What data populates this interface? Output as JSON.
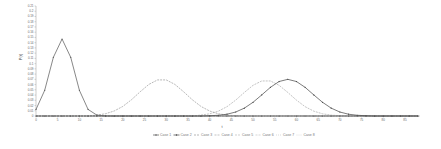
{
  "chart_data": {
    "type": "line",
    "title": "",
    "xlabel": "t",
    "ylabel": "P(t)",
    "xlim": [
      0,
      88
    ],
    "ylim": [
      0,
      0.21
    ],
    "x_ticks": [
      0,
      5,
      10,
      15,
      20,
      25,
      30,
      35,
      40,
      45,
      50,
      55,
      60,
      65,
      70,
      75,
      80,
      85
    ],
    "y_ticks": [
      0,
      0.01,
      0.02,
      0.03,
      0.04,
      0.05,
      0.06,
      0.07,
      0.08,
      0.09,
      0.1,
      0.11,
      0.12,
      0.13,
      0.14,
      0.15,
      0.16,
      0.17,
      0.18,
      0.19,
      0.2,
      0.21
    ],
    "y_tick_labels": [
      "0",
      "0.01",
      "0.02",
      "0.03",
      "0.04",
      "0.05",
      "0.06",
      "0.07",
      "0.08",
      "0.09",
      "0.1",
      "0.11",
      "0.12",
      "0.13",
      "0.14",
      "0.15",
      "0.16",
      "0.17",
      "0.18",
      "0.19",
      "0.2",
      "0.21"
    ],
    "grid": false,
    "legend_position": "bottom",
    "x": [
      0,
      2,
      4,
      6,
      8,
      10,
      12,
      14,
      16,
      18,
      20,
      22,
      24,
      26,
      28,
      30,
      32,
      34,
      36,
      38,
      40,
      42,
      44,
      46,
      48,
      50,
      52,
      54,
      56,
      58,
      60,
      62,
      64,
      66,
      68,
      70,
      72,
      74,
      76,
      78,
      80,
      82,
      84,
      86,
      88
    ],
    "series": [
      {
        "name": "Case 1",
        "color": "#555555",
        "dash": "",
        "marker": true,
        "values": [
          0.0125,
          0.049,
          0.112,
          0.147,
          0.112,
          0.049,
          0.0125,
          0.0018,
          0.0001,
          0,
          0,
          0,
          0,
          0,
          0,
          0,
          0,
          0,
          0,
          0,
          0,
          0,
          0,
          0,
          0,
          0,
          0,
          0,
          0,
          0,
          0,
          0,
          0,
          0,
          0,
          0,
          0,
          0,
          0,
          0,
          0,
          0,
          0,
          0,
          0
        ]
      },
      {
        "name": "Case 2",
        "color": "#444444",
        "dash": "",
        "marker": true,
        "values": [
          0,
          0,
          0,
          0,
          0,
          0,
          0,
          0,
          0,
          0,
          0,
          0,
          0,
          0,
          0,
          0,
          0,
          0,
          0,
          0,
          0.0005,
          0.0014,
          0.0034,
          0.0076,
          0.015,
          0.0262,
          0.0402,
          0.0547,
          0.0658,
          0.07,
          0.0658,
          0.0547,
          0.0402,
          0.0262,
          0.015,
          0.0076,
          0.0034,
          0.0014,
          0.0005,
          0,
          0,
          0,
          0,
          0,
          0
        ]
      },
      {
        "name": "Case 3",
        "color": "#999999",
        "dash": "2,1",
        "marker": false,
        "values": [
          0,
          0,
          0,
          0,
          0,
          0,
          0,
          0.0017,
          0.0043,
          0.0095,
          0.0183,
          0.0311,
          0.0463,
          0.0603,
          0.0689,
          0.0689,
          0.0603,
          0.0463,
          0.0311,
          0.0183,
          0.0095,
          0.0043,
          0.0017,
          0.0006,
          0,
          0,
          0,
          0,
          0,
          0,
          0,
          0,
          0,
          0,
          0,
          0,
          0,
          0,
          0,
          0,
          0,
          0,
          0,
          0,
          0
        ]
      },
      {
        "name": "Case 4",
        "color": "#aaaaaa",
        "dash": "2,1",
        "marker": false,
        "values": [
          0,
          0,
          0,
          0,
          0,
          0,
          0,
          0,
          0,
          0,
          0,
          0,
          0,
          0,
          0,
          0,
          0,
          0,
          0,
          0.0017,
          0.0042,
          0.0092,
          0.0178,
          0.0303,
          0.045,
          0.0586,
          0.0669,
          0.0669,
          0.0586,
          0.045,
          0.0303,
          0.0178,
          0.0092,
          0.0042,
          0.0017,
          0.0006,
          0,
          0,
          0,
          0,
          0,
          0,
          0,
          0,
          0
        ]
      },
      {
        "name": "Case 5",
        "color": "#bbbbbb",
        "dash": "2,1",
        "marker": false,
        "values": [
          0,
          0,
          0,
          0,
          0,
          0,
          0,
          0,
          0,
          0,
          0,
          0,
          0,
          0,
          0,
          0,
          0,
          0,
          0,
          0,
          0,
          0,
          0,
          0,
          0,
          0,
          0,
          0,
          0,
          0,
          0,
          0,
          0,
          0,
          0,
          0,
          0,
          0,
          0,
          0,
          0,
          0,
          0,
          0,
          0
        ]
      },
      {
        "name": "Case 6",
        "color": "#c4c4c4",
        "dash": "2,1",
        "marker": false,
        "values": [
          0,
          0,
          0,
          0,
          0,
          0,
          0,
          0,
          0,
          0,
          0,
          0,
          0,
          0,
          0,
          0,
          0,
          0,
          0,
          0,
          0,
          0,
          0,
          0,
          0,
          0,
          0,
          0,
          0,
          0,
          0,
          0,
          0,
          0,
          0,
          0,
          0,
          0,
          0,
          0,
          0,
          0,
          0,
          0,
          0
        ]
      },
      {
        "name": "Case 7",
        "color": "#cccccc",
        "dash": "1,1",
        "marker": false,
        "values": [
          0,
          0,
          0,
          0,
          0,
          0,
          0,
          0,
          0,
          0,
          0,
          0,
          0,
          0,
          0,
          0,
          0,
          0,
          0,
          0,
          0,
          0,
          0,
          0,
          0,
          0,
          0,
          0,
          0,
          0,
          0,
          0,
          0,
          0,
          0,
          0,
          0,
          0,
          0,
          0,
          0,
          0,
          0,
          0,
          0
        ]
      },
      {
        "name": "Case 8",
        "color": "#d4d4d4",
        "dash": "1,1",
        "marker": false,
        "values": [
          0,
          0,
          0,
          0,
          0,
          0,
          0,
          0,
          0,
          0,
          0,
          0,
          0,
          0,
          0,
          0,
          0,
          0,
          0,
          0,
          0,
          0,
          0,
          0,
          0,
          0,
          0,
          0,
          0,
          0,
          0,
          0,
          0,
          0,
          0,
          0,
          0,
          0,
          0,
          0,
          0,
          0,
          0,
          0,
          0
        ]
      }
    ]
  }
}
